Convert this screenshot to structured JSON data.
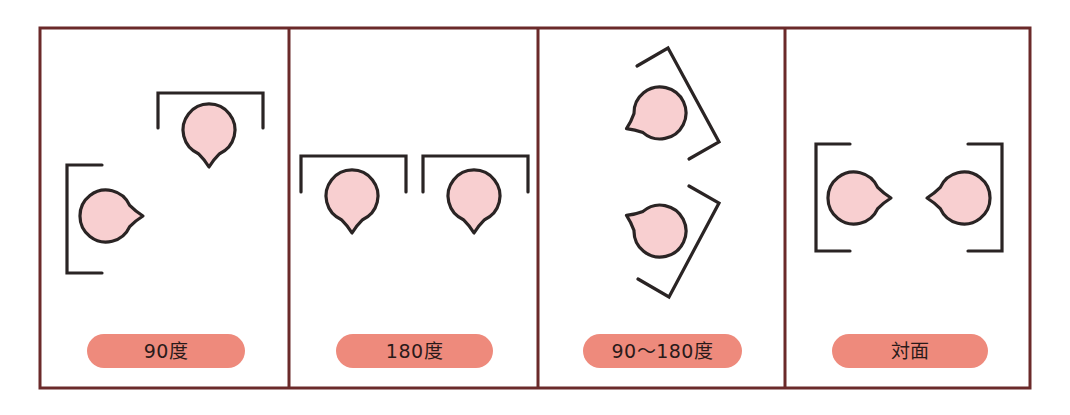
{
  "colors": {
    "frame": "#6b2a2a",
    "stroke": "#2a2424",
    "person_fill": "#f8cfd0",
    "label_bg": "#ee8a7c",
    "label_text": "#2a1a1a"
  },
  "frame": {
    "left": 40,
    "top": 28,
    "right": 1030,
    "bottom": 388,
    "dividers": [
      289,
      538,
      785
    ]
  },
  "panels": [
    {
      "id": "90",
      "label": "90度",
      "x0": 40,
      "x1": 289,
      "label_box": {
        "left": 87,
        "width": 158
      },
      "people": [
        {
          "cx": 209,
          "cy": 130,
          "r": 26,
          "dir": 90
        },
        {
          "cx": 106,
          "cy": 216,
          "r": 26,
          "dir": 0
        }
      ],
      "brackets": [
        [
          [
            158,
            128
          ],
          [
            158,
            93
          ],
          [
            263,
            93
          ],
          [
            263,
            128
          ]
        ],
        [
          [
            102,
            165
          ],
          [
            67,
            165
          ],
          [
            67,
            273
          ],
          [
            102,
            273
          ]
        ]
      ]
    },
    {
      "id": "180",
      "label": "180度",
      "x0": 289,
      "x1": 538,
      "label_box": {
        "left": 336,
        "width": 157
      },
      "people": [
        {
          "cx": 352,
          "cy": 196,
          "r": 26,
          "dir": 90
        },
        {
          "cx": 474,
          "cy": 196,
          "r": 26,
          "dir": 90
        }
      ],
      "brackets": [
        [
          [
            301,
            192
          ],
          [
            301,
            156
          ],
          [
            406,
            156
          ],
          [
            406,
            192
          ]
        ],
        [
          [
            423,
            192
          ],
          [
            423,
            156
          ],
          [
            528,
            156
          ],
          [
            528,
            192
          ]
        ]
      ]
    },
    {
      "id": "90-180",
      "label": "90〜180度",
      "x0": 538,
      "x1": 785,
      "label_box": {
        "left": 583,
        "width": 159
      },
      "people": [
        {
          "cx": 660,
          "cy": 113,
          "r": 26,
          "dir": 155
        },
        {
          "cx": 660,
          "cy": 231,
          "r": 26,
          "dir": 205
        }
      ],
      "brackets": [
        [
          [
            637,
            66
          ],
          [
            668,
            48
          ],
          [
            719,
            142
          ],
          [
            689,
            159
          ]
        ],
        [
          [
            689,
            186
          ],
          [
            719,
            203
          ],
          [
            669,
            297
          ],
          [
            638,
            279
          ]
        ]
      ]
    },
    {
      "id": "facing",
      "label": "対面",
      "x0": 785,
      "x1": 1030,
      "label_box": {
        "left": 832,
        "width": 156
      },
      "people": [
        {
          "cx": 854,
          "cy": 198,
          "r": 26,
          "dir": 0
        },
        {
          "cx": 964,
          "cy": 198,
          "r": 26,
          "dir": 180
        }
      ],
      "brackets": [
        [
          [
            850,
            144
          ],
          [
            816,
            144
          ],
          [
            816,
            251
          ],
          [
            850,
            251
          ]
        ],
        [
          [
            968,
            144
          ],
          [
            1002,
            144
          ],
          [
            1002,
            251
          ],
          [
            968,
            251
          ]
        ]
      ]
    }
  ]
}
